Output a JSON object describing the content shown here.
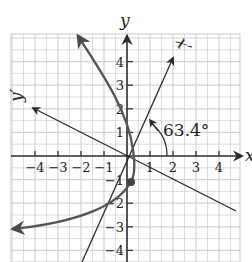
{
  "figure": {
    "axes": {
      "x_label": "x",
      "y_label": "y",
      "x_prime_label": "x′",
      "y_prime_label": "y′",
      "x_ticks": [
        -4,
        -3,
        -2,
        -1,
        1,
        2,
        3,
        4
      ],
      "y_ticks": [
        -4,
        -3,
        -2,
        -1,
        1,
        2,
        3,
        4
      ],
      "x_tick_labels": [
        "−4",
        "−3",
        "−2",
        "−1",
        "1",
        "2",
        "3",
        "4"
      ],
      "y_tick_labels": [
        "4",
        "3",
        "2",
        "1",
        "−1",
        "−2",
        "−3",
        "−4"
      ]
    },
    "rotation_angle_label": "63.4°",
    "colors": {
      "grid": "#d4d4d4",
      "axes": "#333333",
      "curve": "#555555",
      "rotated_axes": "#333333"
    }
  },
  "chart_data": {
    "type": "diagram",
    "xlim": [
      -4.5,
      4.5
    ],
    "ylim": [
      -4.5,
      4.5
    ],
    "grid": true,
    "rotation_angle_deg": 63.4,
    "x_prime_axis_direction": [
      1,
      2
    ],
    "y_prime_axis_direction": [
      -2,
      1
    ],
    "curve": {
      "type": "parabola",
      "vertex_approx": [
        0.4,
        -1.1
      ],
      "arrow_ends": [
        [
          -2.0,
          4.5
        ],
        [
          -4.5,
          -3.0
        ]
      ]
    },
    "highlighted_point": [
      0.4,
      -1.1
    ]
  }
}
